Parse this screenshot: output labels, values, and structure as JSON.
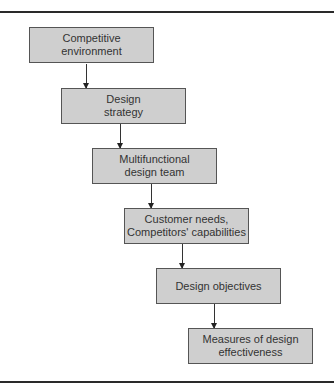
{
  "diagram": {
    "type": "flowchart",
    "direction": "top-to-bottom cascading",
    "nodes": [
      {
        "id": "n1",
        "label": "Competitive\nenvironment"
      },
      {
        "id": "n2",
        "label": "Design\nstrategy"
      },
      {
        "id": "n3",
        "label": "Multifunctional\ndesign team"
      },
      {
        "id": "n4",
        "label": "Customer needs,\nCompetitors' capabilities"
      },
      {
        "id": "n5",
        "label": "Design objectives"
      },
      {
        "id": "n6",
        "label": "Measures of design\neffectiveness"
      }
    ],
    "edges": [
      {
        "from": "n1",
        "to": "n2"
      },
      {
        "from": "n2",
        "to": "n3"
      },
      {
        "from": "n3",
        "to": "n4"
      },
      {
        "from": "n4",
        "to": "n5"
      },
      {
        "from": "n5",
        "to": "n6"
      }
    ],
    "colors": {
      "box_fill": "#cfcfcf",
      "box_border": "#555555",
      "line": "#2a2a2a"
    }
  }
}
